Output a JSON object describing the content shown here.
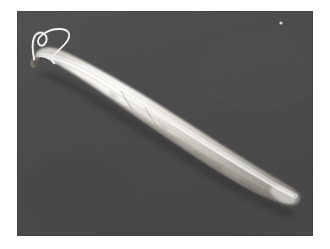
{
  "figure": {
    "domain_label": "scanning-electron-micrograph",
    "caption": "",
    "scale_bar_label": "",
    "border": {
      "page_background_color": "#ffffff",
      "margin_left_px": 17,
      "margin_top_px": 11,
      "margin_right_px": 17,
      "margin_bottom_px": 13
    },
    "micrograph": {
      "width_px": 296,
      "height_px": 225,
      "background_color": "#4b4b4b",
      "background_color_secondary": "#454545",
      "grain": "fine film grain",
      "illumination": "from upper-left"
    },
    "specimen": {
      "body_color_highlight": "#f2f0ec",
      "body_color_mid": "#d8d5ce",
      "body_color_shadow": "#8e8b85",
      "orientation": "anterior upper-left to posterior lower-right",
      "anterior_tip_px": [
        33,
        68
      ],
      "posterior_tip_px": [
        292,
        199
      ],
      "max_width_px": 34,
      "surface_texture": "fine longitudinal striations"
    },
    "flagellum": {
      "color": "#e8e6e0",
      "stroke_width_px": 2,
      "description": "single anterior flagellum forming an open S / hooked loop above the cell body",
      "origin_px": [
        33,
        66
      ],
      "hook_apex_px": [
        64,
        28
      ]
    },
    "artifacts": [
      {
        "name": "dust-speck",
        "position_px": [
          281,
          23
        ],
        "size_px": 2,
        "color": "#d0cec8"
      }
    ]
  }
}
